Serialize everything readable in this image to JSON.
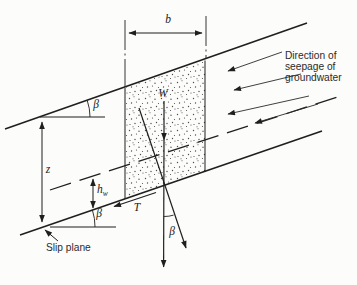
{
  "figure": {
    "background": "#fcfcfa",
    "ink_color": "#1f1f1f",
    "labels": {
      "width_b": "b",
      "weight_W": "W",
      "depth_z": "z",
      "water_height_main": "h",
      "water_height_sub": "w",
      "shear_T": "T",
      "beta": "β",
      "slip_plane": "Slip plane",
      "seepage_line1": "Direction of",
      "seepage_line2": "seepage of",
      "seepage_line3": "groundwater"
    }
  }
}
